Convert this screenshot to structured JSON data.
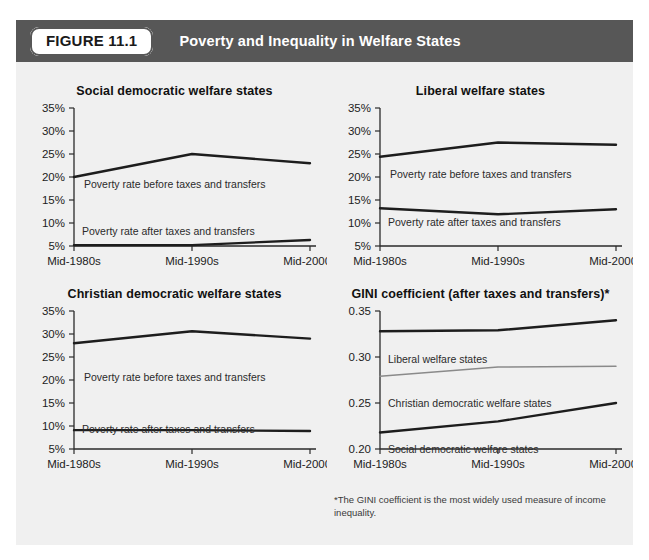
{
  "header": {
    "badge_label": "FIGURE 11.1",
    "title": "Poverty and Inequality in Welfare States",
    "bar_color": "#575757",
    "badge_bg": "#ffffff"
  },
  "footnote": "*The GINI coefficient is the most widely used measure of income inequality.",
  "axis": {
    "x_categories": [
      "Mid-1980s",
      "Mid-1990s",
      "Mid-2000s"
    ],
    "percent_ticks": [
      "5%",
      "10%",
      "15%",
      "20%",
      "25%",
      "30%",
      "35%"
    ],
    "gini_ticks": [
      "0.20",
      "0.25",
      "0.30",
      "0.35"
    ]
  },
  "chart_data": [
    {
      "id": "social",
      "type": "line",
      "title": "Social democratic welfare states",
      "xlabel": "",
      "ylabel": "",
      "x": [
        "Mid-1980s",
        "Mid-1990s",
        "Mid-2000s"
      ],
      "ylim": [
        5,
        35
      ],
      "yticks": [
        5,
        10,
        15,
        20,
        25,
        30,
        35
      ],
      "ytick_labels": [
        "5%",
        "10%",
        "15%",
        "20%",
        "25%",
        "30%",
        "35%"
      ],
      "grid": false,
      "legend": "inline-annotations",
      "series": [
        {
          "name": "Poverty rate before taxes and transfers",
          "values": [
            20.0,
            25.0,
            23.0
          ],
          "color": "#1d1d1d",
          "annotation": "Poverty rate before taxes and transfers"
        },
        {
          "name": "Poverty rate after taxes and transfers",
          "values": [
            5.2,
            5.2,
            6.3
          ],
          "color": "#1d1d1d",
          "annotation": "Poverty rate after taxes and transfers"
        }
      ]
    },
    {
      "id": "liberal",
      "type": "line",
      "title": "Liberal welfare states",
      "xlabel": "",
      "ylabel": "",
      "x": [
        "Mid-1980s",
        "Mid-1990s",
        "Mid-2000s"
      ],
      "ylim": [
        5,
        35
      ],
      "yticks": [
        5,
        10,
        15,
        20,
        25,
        30,
        35
      ],
      "ytick_labels": [
        "5%",
        "10%",
        "15%",
        "20%",
        "25%",
        "30%",
        "35%"
      ],
      "grid": false,
      "legend": "inline-annotations",
      "series": [
        {
          "name": "Poverty rate before taxes and transfers",
          "values": [
            24.4,
            27.5,
            27.0
          ],
          "color": "#1d1d1d",
          "annotation": "Poverty rate before taxes and transfers"
        },
        {
          "name": "Poverty rate after taxes and transfers",
          "values": [
            13.2,
            11.9,
            13.0
          ],
          "color": "#1d1d1d",
          "annotation": "Poverty rate after taxes and transfers"
        }
      ]
    },
    {
      "id": "christian",
      "type": "line",
      "title": "Christian democratic welfare states",
      "xlabel": "",
      "ylabel": "",
      "x": [
        "Mid-1980s",
        "Mid-1990s",
        "Mid-2000s"
      ],
      "ylim": [
        5,
        35
      ],
      "yticks": [
        5,
        10,
        15,
        20,
        25,
        30,
        35
      ],
      "ytick_labels": [
        "5%",
        "10%",
        "15%",
        "20%",
        "25%",
        "30%",
        "35%"
      ],
      "grid": false,
      "legend": "inline-annotations",
      "series": [
        {
          "name": "Poverty rate before taxes and transfers",
          "values": [
            28.0,
            30.6,
            29.0
          ],
          "color": "#1d1d1d",
          "annotation": "Poverty rate before taxes and transfers"
        },
        {
          "name": "Poverty rate after taxes and transfers",
          "values": [
            9.1,
            9.1,
            8.9
          ],
          "color": "#1d1d1d",
          "annotation": "Poverty rate after taxes and transfers"
        }
      ]
    },
    {
      "id": "gini",
      "type": "line",
      "title": "GINI coefficient (after taxes and transfers)*",
      "xlabel": "",
      "ylabel": "",
      "x": [
        "Mid-1980s",
        "Mid-1990s",
        "Mid-2000s"
      ],
      "ylim": [
        0.2,
        0.35
      ],
      "yticks": [
        0.2,
        0.25,
        0.3,
        0.35
      ],
      "ytick_labels": [
        "0.20",
        "0.25",
        "0.30",
        "0.35"
      ],
      "grid": false,
      "legend": "inline-annotations",
      "series": [
        {
          "name": "Liberal welfare states",
          "values": [
            0.328,
            0.329,
            0.34
          ],
          "color": "#1d1d1d",
          "annotation": "Liberal welfare states"
        },
        {
          "name": "Christian democratic welfare states",
          "values": [
            0.279,
            0.289,
            0.29
          ],
          "color": "#8a8a8a",
          "annotation": "Christian democratic welfare states"
        },
        {
          "name": "Social democratic welfare states",
          "values": [
            0.218,
            0.23,
            0.25
          ],
          "color": "#1d1d1d",
          "annotation": "Social democratic welfare states"
        }
      ]
    }
  ]
}
